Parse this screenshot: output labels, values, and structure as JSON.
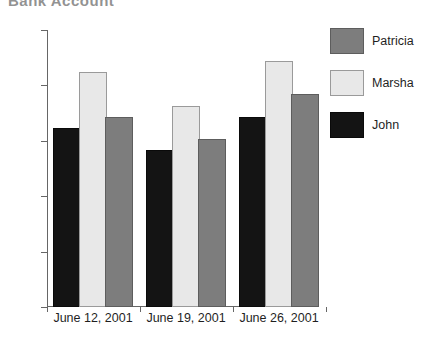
{
  "chart_data": {
    "type": "bar",
    "title": "Bank Account",
    "title_clipped": true,
    "categories": [
      "June 12, 2001",
      "June 19, 2001",
      "June 26, 2001"
    ],
    "series": [
      {
        "name": "John",
        "color": "#141414",
        "values": [
          160,
          140,
          170
        ]
      },
      {
        "name": "Marsha",
        "color": "#e8e8e8",
        "values": [
          210,
          180,
          220
        ]
      },
      {
        "name": "Patricia",
        "color": "#7d7d7d",
        "values": [
          170,
          150,
          190
        ]
      }
    ],
    "xlabel": "",
    "ylabel": "",
    "ylim": [
      0,
      250
    ],
    "y_ticks": [
      0,
      50,
      100,
      150,
      200,
      250
    ],
    "y_tick_labels": [
      "0",
      "50",
      "100",
      "150",
      "200",
      "250"
    ],
    "grid": false,
    "legend_position": "right",
    "legend_order": [
      "Patricia",
      "Marsha",
      "John"
    ],
    "bar_order_in_group": [
      "John",
      "Marsha",
      "Patricia"
    ]
  },
  "legend": {
    "entries": [
      {
        "label": "Patricia",
        "key": "patricia"
      },
      {
        "label": "Marsha",
        "key": "marsha"
      },
      {
        "label": "John",
        "key": "john"
      }
    ]
  }
}
